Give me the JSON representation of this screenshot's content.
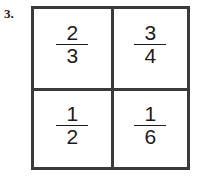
{
  "worksheet": {
    "problem_number": "3.",
    "grid": {
      "rows": 2,
      "columns": 2,
      "border_color": "#3a3a3a",
      "background_color": "#ffffff",
      "cells": [
        {
          "position": "top-left",
          "numerator": "2",
          "denominator": "3",
          "fraction": "2/3"
        },
        {
          "position": "top-right",
          "numerator": "3",
          "denominator": "4",
          "fraction": "3/4"
        },
        {
          "position": "bottom-left",
          "numerator": "1",
          "denominator": "2",
          "fraction": "1/2"
        },
        {
          "position": "bottom-right",
          "numerator": "1",
          "denominator": "6",
          "fraction": "1/6"
        }
      ]
    }
  }
}
